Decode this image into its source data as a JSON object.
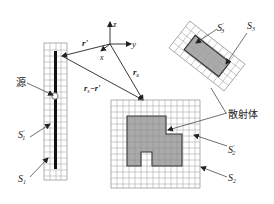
{
  "diagram": {
    "type": "scattering-geometry",
    "coordinate_axes": {
      "z": "z",
      "y": "y",
      "x": "x"
    },
    "vectors": {
      "r_prime": "r'",
      "r_s": "r",
      "r_s_sub": "s",
      "r_diff": "r",
      "r_diff_sub": "s",
      "r_diff_tail": "−r'"
    },
    "labels": {
      "source": "源",
      "scatterer": "散射体",
      "S1": "S",
      "S1_sub": "1",
      "S1p": "S",
      "S1p_sub": "1",
      "S1p_sup": "'",
      "S2": "S",
      "S2_sub": "2",
      "S2p": "S",
      "S2p_sub": "2",
      "S2p_sup": "'",
      "S3": "S",
      "S3_sub": "3",
      "S3p": "S",
      "S3p_sub": "3",
      "S3p_sup": "'"
    },
    "colors": {
      "grid": "#9a9a9a",
      "scatterer_fill": "#9b9b9b",
      "line": "#333333",
      "source_bar": "#111111"
    }
  }
}
